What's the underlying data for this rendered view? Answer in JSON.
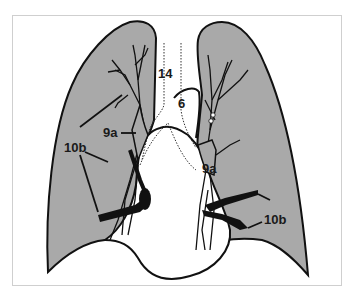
{
  "figure": {
    "type": "anatomical-diagram",
    "colors": {
      "lung_fill": "#a9a9a9",
      "outline": "#111111",
      "background": "#ffffff",
      "frame_border": "#cfcfcf"
    }
  },
  "labels": {
    "station_14": "14",
    "station_6": "6",
    "station_9a_right": "9a",
    "station_9a_left": "9a",
    "station_10b_right": "10b",
    "station_10b_left": "10b"
  }
}
